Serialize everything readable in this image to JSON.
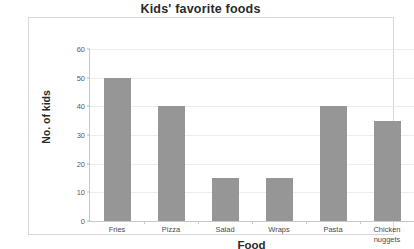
{
  "chart_data": {
    "type": "bar",
    "title": "Kids' favorite foods",
    "xlabel": "Food",
    "ylabel": "No. of kids",
    "categories": [
      "Fries",
      "Pizza",
      "Salad",
      "Wraps",
      "Pasta",
      "Chicken nuggets"
    ],
    "category_lines": [
      [
        "Fries"
      ],
      [
        "Pizza"
      ],
      [
        "Salad"
      ],
      [
        "Wraps"
      ],
      [
        "Pasta"
      ],
      [
        "Chicken",
        "nuggets"
      ]
    ],
    "values": [
      50,
      40,
      15,
      15,
      40,
      35
    ],
    "ylim": [
      0,
      60
    ],
    "ytick_labels": [
      "60",
      "50",
      "40",
      "30",
      "20",
      "10",
      "0"
    ],
    "ytick_values": [
      60,
      50,
      40,
      30,
      20,
      10,
      0
    ],
    "grid": true,
    "legend": false,
    "bar_color": "#969696",
    "gridline_color": "#ededed",
    "axis_color": "#c9c9c9",
    "plot_background": "#ffffff",
    "frame_border_color": "#d8d8d8",
    "text_color": "#2b2b2b"
  }
}
